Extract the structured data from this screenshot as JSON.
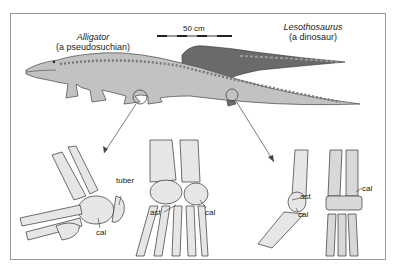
{
  "figure": {
    "scale_bar": {
      "label": "50 cm"
    },
    "taxa": [
      {
        "name": "Alligator",
        "descriptor": "(a pseudosuchian)"
      },
      {
        "name": "Lesothosaurus",
        "descriptor": "(a dinosaur)"
      }
    ],
    "left_panel_labels": {
      "tuber": "tuber",
      "cal": "cal",
      "ast": "ast",
      "cal2": "cal"
    },
    "right_panel_labels": {
      "ast": "ast",
      "cal": "cal",
      "cal2": "cal"
    },
    "colors": {
      "frame": "#9a9a9a",
      "ink": "#333333",
      "bone": "#e8e8e8",
      "skin": "#b5b5b5",
      "dark_skin": "#555555"
    }
  }
}
